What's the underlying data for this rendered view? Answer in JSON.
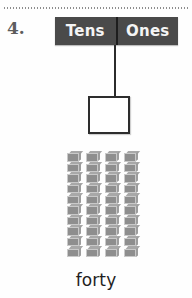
{
  "worksheet": {
    "problem_number": "4.",
    "divider_rule": "dotted-rule",
    "place_value_chart": {
      "tens_label": "Tens",
      "ones_label": "Ones",
      "header_bg_color": "#4a4a4a",
      "header_text_color": "#f4f4f4",
      "divider_color": "#1d1d1d"
    },
    "answer_box": {
      "value": "",
      "placeholder": "",
      "border_color": "#2d2d2d",
      "fill_color": "#ffffff"
    },
    "connector": {
      "from": "Tens",
      "to": "answer-box",
      "color": "#2b2b2b"
    },
    "base_ten_blocks": {
      "rod_count": 4,
      "cubes_per_rod": 10,
      "total_units": 40,
      "block_color": "#8e8e8e",
      "block_highlight_color": "#a8a8a8"
    },
    "number_word": "forty"
  }
}
